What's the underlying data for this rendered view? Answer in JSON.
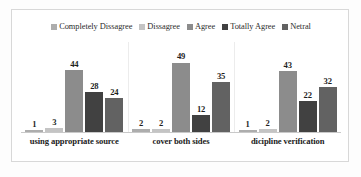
{
  "chart_data": {
    "type": "bar",
    "title": "",
    "subtitle": "",
    "xlabel": "",
    "ylabel": "",
    "grid": false,
    "legend_position": "top",
    "ylim": [
      0,
      55
    ],
    "categories": [
      "using appropriate source",
      "cover both sides",
      "dicipline verification"
    ],
    "series": [
      {
        "name": "Completely Dissagree",
        "color": "#adadad",
        "values": [
          1,
          2,
          1
        ]
      },
      {
        "name": "Dissagree",
        "color": "#c4c4c4",
        "values": [
          3,
          2,
          2
        ]
      },
      {
        "name": "Agree",
        "color": "#8c8c8c",
        "values": [
          44,
          49,
          43
        ]
      },
      {
        "name": "Totally Agree",
        "color": "#414141",
        "values": [
          28,
          12,
          22
        ]
      },
      {
        "name": "Netral",
        "color": "#626262",
        "values": [
          24,
          35,
          32
        ]
      }
    ],
    "data_labels": [
      [
        "1",
        "3",
        "44",
        "28",
        "24"
      ],
      [
        "2",
        "2",
        "49",
        "12",
        "35"
      ],
      [
        "1",
        "2",
        "43",
        "22",
        "32"
      ]
    ]
  },
  "legend": {
    "items": [
      {
        "label": "Completely Dissagree",
        "color": "#adadad"
      },
      {
        "label": "Dissagree",
        "color": "#c4c4c4"
      },
      {
        "label": "Agree",
        "color": "#8c8c8c"
      },
      {
        "label": "Totally Agree",
        "color": "#414141"
      },
      {
        "label": "Netral",
        "color": "#626262"
      }
    ]
  },
  "axis": {
    "category_labels": [
      "using appropriate source",
      "cover both sides",
      "dicipline verification"
    ]
  }
}
